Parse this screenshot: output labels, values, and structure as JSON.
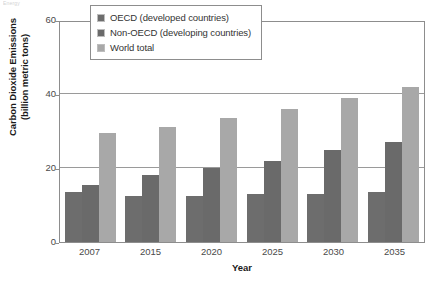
{
  "caption_remnant": "Energy",
  "chart_data": {
    "type": "bar",
    "title": "",
    "xlabel": "Year",
    "ylabel": "Carbon Dioxide Emissions (billion metric tons)",
    "ylabel_line1": "Carbon Dioxide Emissions",
    "ylabel_line2": "(billion metric tons)",
    "categories": [
      "2007",
      "2015",
      "2020",
      "2025",
      "2030",
      "2035"
    ],
    "series": [
      {
        "name": "OECD (developed countries)",
        "color": "#6d6d6d",
        "values": [
          13.5,
          12.5,
          12.5,
          13.0,
          13.0,
          13.5
        ]
      },
      {
        "name": "Non-OECD (developing countries)",
        "color": "#6a6a6a",
        "values": [
          15.5,
          18.0,
          20.0,
          22.0,
          25.0,
          27.0
        ]
      },
      {
        "name": "World total",
        "color": "#a8a8a8",
        "values": [
          29.5,
          31.0,
          33.5,
          36.0,
          39.0,
          42.0
        ]
      }
    ],
    "ylim": [
      0,
      60
    ],
    "yticks": [
      "0",
      "20",
      "40",
      "60"
    ],
    "ytick_values": [
      0,
      20,
      40,
      60
    ],
    "grid": true,
    "legend_position": "top-center"
  }
}
